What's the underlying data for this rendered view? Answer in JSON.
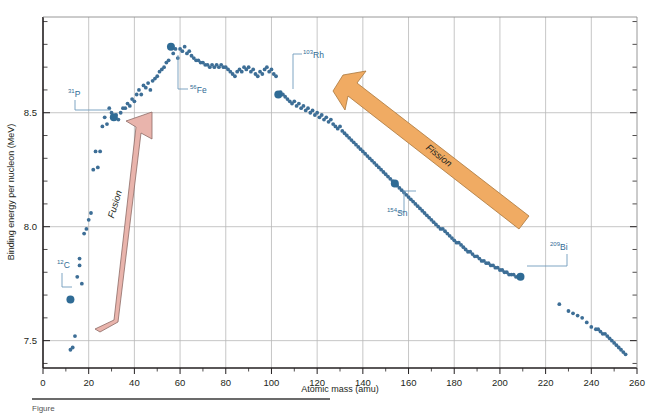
{
  "chart_data": {
    "type": "scatter",
    "title": "",
    "xlabel": "Atomic mass (amu)",
    "ylabel": "Binding energy per nucleon (MeV)",
    "xlim": [
      0,
      260
    ],
    "ylim": [
      7.38,
      8.92
    ],
    "xticks": [
      0,
      20,
      40,
      60,
      80,
      100,
      120,
      140,
      160,
      180,
      200,
      220,
      240,
      260
    ],
    "xtick_labels": [
      "0",
      "20",
      "40",
      "60",
      "80",
      "100",
      "120",
      "140",
      "160",
      "180",
      "200",
      "220",
      "240",
      "260"
    ],
    "xminor_step": 10,
    "yticks": [
      7.5,
      8.0,
      8.5
    ],
    "ytick_labels": [
      "7.5",
      "8.0",
      "8.5"
    ],
    "yminor_step": 0.1,
    "grid": true,
    "grid_color": "#b8b8b8",
    "legend": "none",
    "point_color": "#3d6e96",
    "points": [
      [
        12,
        7.46
      ],
      [
        13,
        7.47
      ],
      [
        14,
        7.52
      ],
      [
        15,
        7.78
      ],
      [
        16,
        7.83
      ],
      [
        16,
        7.86
      ],
      [
        17,
        7.75
      ],
      [
        18,
        7.97
      ],
      [
        19,
        7.99
      ],
      [
        20,
        8.03
      ],
      [
        21,
        8.06
      ],
      [
        22,
        8.25
      ],
      [
        23,
        8.33
      ],
      [
        24,
        8.26
      ],
      [
        25,
        8.33
      ],
      [
        26,
        8.44
      ],
      [
        27,
        8.48
      ],
      [
        28,
        8.45
      ],
      [
        29,
        8.52
      ],
      [
        30,
        8.5
      ],
      [
        31,
        8.48
      ],
      [
        32,
        8.49
      ],
      [
        33,
        8.47
      ],
      [
        34,
        8.5
      ],
      [
        35,
        8.52
      ],
      [
        36,
        8.52
      ],
      [
        37,
        8.54
      ],
      [
        38,
        8.53
      ],
      [
        39,
        8.56
      ],
      [
        40,
        8.55
      ],
      [
        41,
        8.58
      ],
      [
        42,
        8.6
      ],
      [
        43,
        8.58
      ],
      [
        44,
        8.62
      ],
      [
        45,
        8.61
      ],
      [
        46,
        8.63
      ],
      [
        47,
        8.6
      ],
      [
        48,
        8.64
      ],
      [
        49,
        8.65
      ],
      [
        50,
        8.66
      ],
      [
        51,
        8.68
      ],
      [
        52,
        8.69
      ],
      [
        53,
        8.7
      ],
      [
        54,
        8.72
      ],
      [
        55,
        8.73
      ],
      [
        56,
        8.79
      ],
      [
        57,
        8.76
      ],
      [
        58,
        8.78
      ],
      [
        59,
        8.74
      ],
      [
        60,
        8.78
      ],
      [
        61,
        8.77
      ],
      [
        62,
        8.79
      ],
      [
        63,
        8.76
      ],
      [
        64,
        8.77
      ],
      [
        65,
        8.75
      ],
      [
        66,
        8.74
      ],
      [
        67,
        8.73
      ],
      [
        68,
        8.73
      ],
      [
        69,
        8.72
      ],
      [
        70,
        8.72
      ],
      [
        71,
        8.71
      ],
      [
        72,
        8.71
      ],
      [
        73,
        8.7
      ],
      [
        74,
        8.71
      ],
      [
        75,
        8.7
      ],
      [
        76,
        8.71
      ],
      [
        77,
        8.7
      ],
      [
        78,
        8.71
      ],
      [
        79,
        8.7
      ],
      [
        80,
        8.7
      ],
      [
        81,
        8.69
      ],
      [
        82,
        8.68
      ],
      [
        83,
        8.67
      ],
      [
        84,
        8.66
      ],
      [
        85,
        8.68
      ],
      [
        86,
        8.69
      ],
      [
        87,
        8.68
      ],
      [
        88,
        8.7
      ],
      [
        89,
        8.69
      ],
      [
        90,
        8.7
      ],
      [
        91,
        8.68
      ],
      [
        92,
        8.69
      ],
      [
        93,
        8.67
      ],
      [
        94,
        8.66
      ],
      [
        95,
        8.68
      ],
      [
        96,
        8.67
      ],
      [
        97,
        8.69
      ],
      [
        98,
        8.7
      ],
      [
        99,
        8.68
      ],
      [
        100,
        8.69
      ],
      [
        101,
        8.67
      ],
      [
        102,
        8.66
      ],
      [
        103,
        8.58
      ],
      [
        104,
        8.59
      ],
      [
        105,
        8.58
      ],
      [
        106,
        8.57
      ],
      [
        107,
        8.56
      ],
      [
        108,
        8.55
      ],
      [
        109,
        8.54
      ],
      [
        110,
        8.55
      ],
      [
        111,
        8.53
      ],
      [
        112,
        8.54
      ],
      [
        113,
        8.52
      ],
      [
        114,
        8.53
      ],
      [
        115,
        8.51
      ],
      [
        116,
        8.52
      ],
      [
        117,
        8.5
      ],
      [
        118,
        8.51
      ],
      [
        119,
        8.49
      ],
      [
        120,
        8.5
      ],
      [
        121,
        8.48
      ],
      [
        122,
        8.49
      ],
      [
        123,
        8.47
      ],
      [
        124,
        8.48
      ],
      [
        125,
        8.46
      ],
      [
        126,
        8.47
      ],
      [
        127,
        8.45
      ],
      [
        128,
        8.44
      ],
      [
        129,
        8.43
      ],
      [
        130,
        8.44
      ],
      [
        131,
        8.42
      ],
      [
        132,
        8.41
      ],
      [
        133,
        8.4
      ],
      [
        134,
        8.39
      ],
      [
        135,
        8.38
      ],
      [
        136,
        8.37
      ],
      [
        137,
        8.36
      ],
      [
        138,
        8.35
      ],
      [
        139,
        8.34
      ],
      [
        140,
        8.33
      ],
      [
        141,
        8.32
      ],
      [
        142,
        8.31
      ],
      [
        143,
        8.3
      ],
      [
        144,
        8.29
      ],
      [
        145,
        8.28
      ],
      [
        146,
        8.27
      ],
      [
        147,
        8.26
      ],
      [
        148,
        8.25
      ],
      [
        149,
        8.24
      ],
      [
        150,
        8.23
      ],
      [
        151,
        8.22
      ],
      [
        152,
        8.21
      ],
      [
        153,
        8.2
      ],
      [
        154,
        8.19
      ],
      [
        155,
        8.18
      ],
      [
        156,
        8.17
      ],
      [
        157,
        8.16
      ],
      [
        158,
        8.15
      ],
      [
        159,
        8.14
      ],
      [
        160,
        8.13
      ],
      [
        161,
        8.12
      ],
      [
        162,
        8.11
      ],
      [
        163,
        8.1
      ],
      [
        164,
        8.09
      ],
      [
        165,
        8.08
      ],
      [
        166,
        8.07
      ],
      [
        167,
        8.06
      ],
      [
        168,
        8.05
      ],
      [
        169,
        8.04
      ],
      [
        170,
        8.03
      ],
      [
        171,
        8.02
      ],
      [
        172,
        8.01
      ],
      [
        173,
        8.0
      ],
      [
        174,
        7.99
      ],
      [
        175,
        7.99
      ],
      [
        176,
        7.98
      ],
      [
        177,
        7.97
      ],
      [
        178,
        7.96
      ],
      [
        179,
        7.95
      ],
      [
        180,
        7.94
      ],
      [
        181,
        7.93
      ],
      [
        182,
        7.93
      ],
      [
        183,
        7.92
      ],
      [
        184,
        7.91
      ],
      [
        185,
        7.9
      ],
      [
        186,
        7.89
      ],
      [
        187,
        7.89
      ],
      [
        188,
        7.88
      ],
      [
        189,
        7.87
      ],
      [
        190,
        7.87
      ],
      [
        191,
        7.86
      ],
      [
        192,
        7.85
      ],
      [
        193,
        7.85
      ],
      [
        194,
        7.84
      ],
      [
        195,
        7.84
      ],
      [
        196,
        7.83
      ],
      [
        197,
        7.83
      ],
      [
        198,
        7.82
      ],
      [
        199,
        7.82
      ],
      [
        200,
        7.81
      ],
      [
        201,
        7.81
      ],
      [
        202,
        7.8
      ],
      [
        203,
        7.8
      ],
      [
        204,
        7.79
      ],
      [
        205,
        7.79
      ],
      [
        206,
        7.79
      ],
      [
        207,
        7.78
      ],
      [
        208,
        7.78
      ],
      [
        209,
        7.78
      ],
      [
        226,
        7.66
      ],
      [
        230,
        7.63
      ],
      [
        232,
        7.62
      ],
      [
        234,
        7.61
      ],
      [
        236,
        7.6
      ],
      [
        238,
        7.58
      ],
      [
        240,
        7.56
      ],
      [
        242,
        7.55
      ],
      [
        243,
        7.55
      ],
      [
        244,
        7.54
      ],
      [
        245,
        7.53
      ],
      [
        246,
        7.53
      ],
      [
        247,
        7.52
      ],
      [
        248,
        7.51
      ],
      [
        249,
        7.5
      ],
      [
        250,
        7.49
      ],
      [
        251,
        7.48
      ],
      [
        252,
        7.47
      ],
      [
        253,
        7.46
      ],
      [
        254,
        7.45
      ],
      [
        255,
        7.44
      ]
    ],
    "highlighted_points": [
      {
        "id": "C12",
        "mass": 12,
        "energy": 7.68,
        "sup": "12",
        "element": "C",
        "label_x": 57,
        "label_y": 268,
        "leader": "M 72 287 L 62 287 L 62 273"
      },
      {
        "id": "P31",
        "mass": 31,
        "energy": 8.48,
        "sup": "31",
        "element": "P",
        "label_x": 68,
        "label_y": 97,
        "leader": "M 111 110 L 75 110 L 75 100"
      },
      {
        "id": "Fe56",
        "mass": 56,
        "energy": 8.79,
        "sup": "56",
        "element": "Fe",
        "label_x": 190,
        "label_y": 93,
        "leader": "M 178 55 L 178 89 L 188 89"
      },
      {
        "id": "Rh103",
        "mass": 103,
        "energy": 8.58,
        "sup": "103",
        "element": "Rh",
        "label_x": 303,
        "label_y": 58,
        "leader": "M 293 89 L 293 54 L 302 54"
      },
      {
        "id": "Sn154",
        "mass": 154,
        "energy": 8.19,
        "sup": "154",
        "element": "Sn",
        "label_x": 387,
        "label_y": 216,
        "leader": "M 416 191 L 404 191 L 404 212 L 399 212"
      },
      {
        "id": "Bi209",
        "mass": 209,
        "energy": 7.78,
        "sup": "209",
        "element": "Bi",
        "label_x": 550,
        "label_y": 250,
        "leader": "M 527 266 L 567 266 L 567 254"
      }
    ],
    "annotations": [
      {
        "id": "fusion-arrow",
        "label": "Fusion",
        "color": "#e9b4ac",
        "stroke": "#9a7a74",
        "direction": "up-right",
        "label_x": 118,
        "label_y": 205,
        "rotate": -72
      },
      {
        "id": "fission-arrow",
        "label": "Fission",
        "color": "#f0ab63",
        "stroke": "#b07a3c",
        "direction": "up-left",
        "label_x": 437,
        "label_y": 160,
        "rotate": 39
      }
    ]
  },
  "figure": {
    "caption_prefix": "Figure"
  }
}
